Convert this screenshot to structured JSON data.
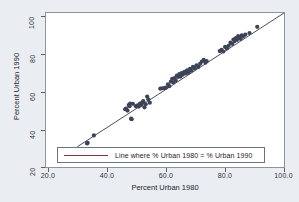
{
  "chart_data": {
    "type": "scatter",
    "title": "",
    "xlabel": "Percent Urban 1980",
    "ylabel": "Percent Urban 1990",
    "xlim": [
      20.0,
      100.0
    ],
    "ylim": [
      20,
      100
    ],
    "xticks": [
      "20.0",
      "40.0",
      "60.0",
      "80.0",
      "100.0"
    ],
    "yticks": [
      "20",
      "40",
      "60",
      "80",
      "100"
    ],
    "xtick_values": [
      20,
      40,
      60,
      80,
      100
    ],
    "ytick_values": [
      20,
      40,
      60,
      80,
      100
    ],
    "grid": false,
    "legend_position": "bottom-center",
    "legend": [
      {
        "label": "Line where % Urban 1980 = % Urban 1990",
        "type": "line",
        "color": "#7a3538"
      }
    ],
    "reference_line": {
      "label": "Line where % Urban 1980 = % Urban 1990",
      "equation": "y = x",
      "x_start": 30.5,
      "y_start": 30.5,
      "x_end": 100.0,
      "y_end": 100.0,
      "color": "#4d4d55"
    },
    "marker": {
      "shape": "circle",
      "color": "#3c4357",
      "size_px": 4.2
    },
    "series": [
      {
        "name": "States",
        "marker_color": "#3c4357",
        "points": [
          [
            33.8,
            32.2
          ],
          [
            34.0,
            32.6
          ],
          [
            36.1,
            36.4
          ],
          [
            46.6,
            50.0
          ],
          [
            46.9,
            50.4
          ],
          [
            47.4,
            49.3
          ],
          [
            47.8,
            52.2
          ],
          [
            48.1,
            51.6
          ],
          [
            48.3,
            53.0
          ],
          [
            48.6,
            45.1
          ],
          [
            48.8,
            44.8
          ],
          [
            49.2,
            52.8
          ],
          [
            50.2,
            51.6
          ],
          [
            50.8,
            52.0
          ],
          [
            51.2,
            51.4
          ],
          [
            51.6,
            53.0
          ],
          [
            52.0,
            52.2
          ],
          [
            52.4,
            53.6
          ],
          [
            52.7,
            54.2
          ],
          [
            53.1,
            51.0
          ],
          [
            53.5,
            52.6
          ],
          [
            54.0,
            56.6
          ],
          [
            54.4,
            55.2
          ],
          [
            54.9,
            53.4
          ],
          [
            58.4,
            60.7
          ],
          [
            59.1,
            60.9
          ],
          [
            59.8,
            61.0
          ],
          [
            60.3,
            61.2
          ],
          [
            61.0,
            63.0
          ],
          [
            61.4,
            62.0
          ],
          [
            62.0,
            64.4
          ],
          [
            62.4,
            65.8
          ],
          [
            62.8,
            64.0
          ],
          [
            63.2,
            66.2
          ],
          [
            63.6,
            65.0
          ],
          [
            64.0,
            67.5
          ],
          [
            64.4,
            66.8
          ],
          [
            64.8,
            68.2
          ],
          [
            65.2,
            67.0
          ],
          [
            65.6,
            68.8
          ],
          [
            66.0,
            68.0
          ],
          [
            66.5,
            69.4
          ],
          [
            67.0,
            68.6
          ],
          [
            67.4,
            70.2
          ],
          [
            67.9,
            69.0
          ],
          [
            68.4,
            71.0
          ],
          [
            68.9,
            70.0
          ],
          [
            69.4,
            72.0
          ],
          [
            70.0,
            71.2
          ],
          [
            70.6,
            72.8
          ],
          [
            71.2,
            72.0
          ],
          [
            71.8,
            73.6
          ],
          [
            72.4,
            74.8
          ],
          [
            73.0,
            75.6
          ],
          [
            73.6,
            74.2
          ],
          [
            74.0,
            75.0
          ],
          [
            78.4,
            80.2
          ],
          [
            79.0,
            80.8
          ],
          [
            79.6,
            80.0
          ],
          [
            80.2,
            82.4
          ],
          [
            80.8,
            81.6
          ],
          [
            81.4,
            83.0
          ],
          [
            82.0,
            84.6
          ],
          [
            82.6,
            84.0
          ],
          [
            83.0,
            86.2
          ],
          [
            83.4,
            85.4
          ],
          [
            83.8,
            87.0
          ],
          [
            84.2,
            86.0
          ],
          [
            84.6,
            88.0
          ],
          [
            85.0,
            87.2
          ],
          [
            85.4,
            86.6
          ],
          [
            85.8,
            88.4
          ],
          [
            86.2,
            87.8
          ],
          [
            87.0,
            88.8
          ],
          [
            88.4,
            89.6
          ],
          [
            91.0,
            92.8
          ]
        ]
      }
    ]
  }
}
